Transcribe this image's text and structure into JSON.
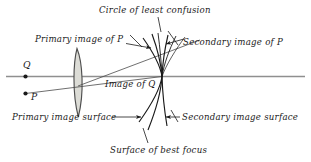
{
  "figure": {
    "labels": {
      "circle_of_least_confusion": "Circle of least confusion",
      "primary_image_of_p": "Primary image of P",
      "secondary_image_of_p": "Secondary image of P",
      "image_of_q": "Image of Q",
      "primary_image_surface": "Primary image surface",
      "secondary_image_surface": "Secondary image surface",
      "surface_of_best_focus": "Surface of best focus",
      "object_point_q": "Q",
      "object_point_p": "P"
    },
    "colors": {
      "ink": "#1a1a1a",
      "axis": "#8a8a8a",
      "lens_fill": "#dcdcd6",
      "lens_stroke": "#555555",
      "background": "#ffffff"
    },
    "elements": {
      "lens": "biconvex-lens",
      "optical_axis": "horizontal-gray-axis",
      "ray_p": "oblique-ray-from-P",
      "curves": [
        "primary-image-surface-curve",
        "surface-of-best-focus-curve",
        "secondary-image-surface-curve"
      ],
      "focus_point": "on-axis-image-of-Q"
    }
  }
}
